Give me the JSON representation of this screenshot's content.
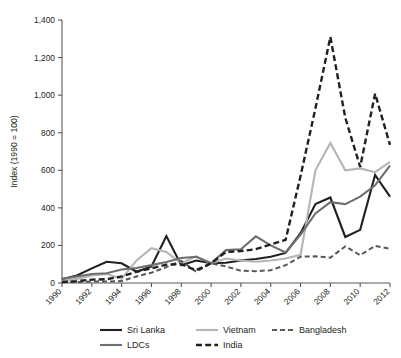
{
  "chart_data": {
    "type": "line",
    "title": "",
    "xlabel": "",
    "ylabel": "Index (1990 = 100)",
    "xlim": [
      1990,
      2012
    ],
    "ylim": [
      0,
      1400
    ],
    "ytick_labels": [
      "0",
      "200",
      "400",
      "600",
      "800",
      "1,000",
      "1,200",
      "1,400"
    ],
    "ytick_values": [
      0,
      200,
      400,
      600,
      800,
      1000,
      1200,
      1400
    ],
    "xtick_labels": [
      "1990",
      "1992",
      "1994",
      "1996",
      "1998",
      "2000",
      "2002",
      "2004",
      "2006",
      "2008",
      "2010",
      "2012"
    ],
    "xtick_values": [
      1990,
      1992,
      1994,
      1996,
      1998,
      2000,
      2002,
      2004,
      2006,
      2008,
      2010,
      2012
    ],
    "grid": false,
    "legend_position": "bottom",
    "x": [
      1990,
      1991,
      1992,
      1993,
      1994,
      1995,
      1996,
      1997,
      1998,
      1999,
      2000,
      2001,
      2002,
      2003,
      2004,
      2005,
      2006,
      2007,
      2008,
      2009,
      2010,
      2011,
      2012
    ],
    "series": [
      {
        "name": "Sri Lanka",
        "color": "#231f20",
        "style": "solid",
        "width": 2.1,
        "values": [
          20,
          40,
          78,
          113,
          105,
          60,
          88,
          250,
          95,
          120,
          105,
          108,
          120,
          128,
          140,
          160,
          265,
          420,
          455,
          245,
          283,
          575,
          460
        ]
      },
      {
        "name": "Vietnam",
        "color": "#b5b5b7",
        "style": "solid",
        "width": 2.1,
        "values": [
          10,
          22,
          40,
          48,
          22,
          120,
          185,
          165,
          105,
          142,
          105,
          130,
          120,
          113,
          120,
          130,
          150,
          600,
          745,
          600,
          610,
          590,
          645
        ]
      },
      {
        "name": "Bangladesh",
        "color": "#58585a",
        "style": "dashed",
        "width": 2.0,
        "values": [
          5,
          5,
          8,
          8,
          10,
          35,
          55,
          85,
          118,
          60,
          105,
          88,
          65,
          63,
          68,
          95,
          140,
          142,
          135,
          195,
          148,
          198,
          182
        ]
      },
      {
        "name": "LDCs",
        "color": "#6d6e71",
        "style": "solid",
        "width": 2.1,
        "values": [
          22,
          35,
          48,
          52,
          72,
          80,
          95,
          112,
          133,
          140,
          105,
          175,
          180,
          248,
          200,
          162,
          258,
          370,
          430,
          420,
          460,
          520,
          625
        ]
      },
      {
        "name": "India",
        "color": "#231f20",
        "style": "dashed",
        "width": 2.4,
        "values": [
          5,
          10,
          18,
          20,
          35,
          60,
          78,
          98,
          100,
          68,
          105,
          165,
          170,
          180,
          205,
          230,
          570,
          930,
          1310,
          880,
          618,
          1008,
          735
        ]
      }
    ]
  },
  "legend": {
    "items": [
      {
        "label": "Sri Lanka"
      },
      {
        "label": "Vietnam"
      },
      {
        "label": "Bangladesh"
      },
      {
        "label": "LDCs"
      },
      {
        "label": "India"
      }
    ]
  }
}
